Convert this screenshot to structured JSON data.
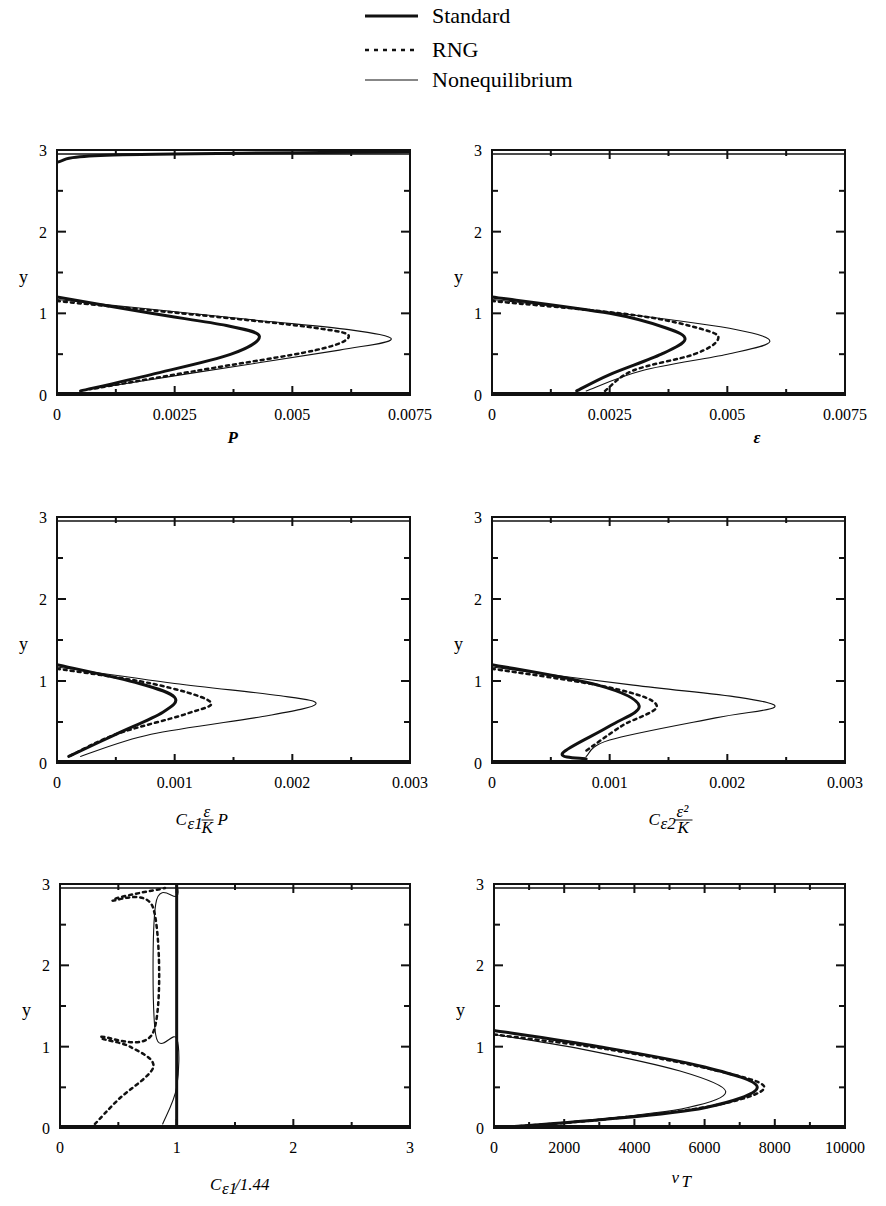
{
  "legend": {
    "entries": [
      {
        "name": "Standard",
        "style": "thick-solid"
      },
      {
        "name": "RNG",
        "style": "dotted"
      },
      {
        "name": "Nonequilibrium",
        "style": "thin-solid"
      }
    ]
  },
  "chart_data": [
    {
      "type": "line",
      "title": "",
      "xlabel": "P",
      "ylabel": "y",
      "xlim": [
        0,
        0.0075
      ],
      "ylim": [
        0,
        3
      ],
      "xticks": [
        "0",
        "0.0025",
        "0.005",
        "0.0075"
      ],
      "yticks": [
        "0",
        "1",
        "2",
        "3"
      ],
      "series": [
        {
          "name": "Standard",
          "points": [
            [
              0.0,
              1.2
            ],
            [
              0.002,
              1.0
            ],
            [
              0.0036,
              0.85
            ],
            [
              0.0043,
              0.72
            ],
            [
              0.0037,
              0.5
            ],
            [
              0.002,
              0.25
            ],
            [
              0.0005,
              0.05
            ],
            [
              0.0,
              2.85
            ],
            [
              0.0012,
              2.94
            ],
            [
              0.0075,
              2.98
            ]
          ]
        },
        {
          "name": "RNG",
          "points": [
            [
              0.0,
              1.15
            ],
            [
              0.0035,
              0.95
            ],
            [
              0.0055,
              0.82
            ],
            [
              0.0062,
              0.72
            ],
            [
              0.0055,
              0.55
            ],
            [
              0.003,
              0.3
            ],
            [
              0.0007,
              0.07
            ]
          ]
        },
        {
          "name": "Nonequilibrium",
          "points": [
            [
              0.0,
              1.17
            ],
            [
              0.004,
              0.93
            ],
            [
              0.0062,
              0.8
            ],
            [
              0.0071,
              0.68
            ],
            [
              0.006,
              0.55
            ],
            [
              0.003,
              0.28
            ],
            [
              0.0007,
              0.07
            ]
          ]
        }
      ]
    },
    {
      "type": "line",
      "title": "",
      "xlabel": "ε",
      "ylabel": "y",
      "xlim": [
        0,
        0.0075
      ],
      "ylim": [
        0,
        3
      ],
      "xticks": [
        "0",
        "0.0025",
        "0.005",
        "0.0075"
      ],
      "yticks": [
        "0",
        "1",
        "2",
        "3"
      ],
      "series": [
        {
          "name": "Standard",
          "points": [
            [
              0.0,
              1.2
            ],
            [
              0.0025,
              1.0
            ],
            [
              0.0037,
              0.82
            ],
            [
              0.0041,
              0.68
            ],
            [
              0.0036,
              0.5
            ],
            [
              0.0025,
              0.25
            ],
            [
              0.0018,
              0.05
            ]
          ]
        },
        {
          "name": "RNG",
          "points": [
            [
              0.0,
              1.15
            ],
            [
              0.003,
              0.98
            ],
            [
              0.0045,
              0.8
            ],
            [
              0.0048,
              0.68
            ],
            [
              0.0043,
              0.5
            ],
            [
              0.003,
              0.3
            ],
            [
              0.0024,
              0.05
            ]
          ]
        },
        {
          "name": "Nonequilibrium",
          "points": [
            [
              0.0,
              1.17
            ],
            [
              0.003,
              0.98
            ],
            [
              0.0052,
              0.8
            ],
            [
              0.0059,
              0.65
            ],
            [
              0.005,
              0.5
            ],
            [
              0.0032,
              0.3
            ],
            [
              0.002,
              0.05
            ]
          ]
        }
      ]
    },
    {
      "type": "line",
      "title": "",
      "xlabel": "Cε1 (ε/K) P",
      "ylabel": "y",
      "xlim": [
        0,
        0.003
      ],
      "ylim": [
        0,
        3
      ],
      "xticks": [
        "0",
        "0.001",
        "0.002",
        "0.003"
      ],
      "yticks": [
        "0",
        "1",
        "2",
        "3"
      ],
      "series": [
        {
          "name": "Standard",
          "points": [
            [
              0.0,
              1.2
            ],
            [
              0.0007,
              0.97
            ],
            [
              0.001,
              0.8
            ],
            [
              0.0009,
              0.62
            ],
            [
              0.0005,
              0.35
            ],
            [
              0.0001,
              0.08
            ]
          ]
        },
        {
          "name": "RNG",
          "points": [
            [
              0.0,
              1.15
            ],
            [
              0.0008,
              0.97
            ],
            [
              0.0013,
              0.75
            ],
            [
              0.0011,
              0.6
            ],
            [
              0.0005,
              0.35
            ],
            [
              0.0001,
              0.08
            ]
          ]
        },
        {
          "name": "Nonequilibrium",
          "points": [
            [
              0.0,
              1.17
            ],
            [
              0.001,
              0.97
            ],
            [
              0.0019,
              0.82
            ],
            [
              0.0022,
              0.72
            ],
            [
              0.0018,
              0.58
            ],
            [
              0.0008,
              0.35
            ],
            [
              0.0002,
              0.08
            ]
          ]
        }
      ]
    },
    {
      "type": "line",
      "title": "",
      "xlabel": "Cε2 ε²/K",
      "ylabel": "y",
      "xlim": [
        0,
        0.003
      ],
      "ylim": [
        0,
        3
      ],
      "xticks": [
        "0",
        "0.001",
        "0.002",
        "0.003"
      ],
      "yticks": [
        "0",
        "1",
        "2",
        "3"
      ],
      "series": [
        {
          "name": "Standard",
          "points": [
            [
              0.0,
              1.2
            ],
            [
              0.0009,
              0.95
            ],
            [
              0.00125,
              0.7
            ],
            [
              0.001,
              0.45
            ],
            [
              0.0006,
              0.12
            ],
            [
              0.0008,
              0.05
            ]
          ]
        },
        {
          "name": "RNG",
          "points": [
            [
              0.0,
              1.15
            ],
            [
              0.001,
              0.92
            ],
            [
              0.0014,
              0.7
            ],
            [
              0.0011,
              0.45
            ],
            [
              0.0008,
              0.15
            ]
          ]
        },
        {
          "name": "Nonequilibrium",
          "points": [
            [
              0.0,
              1.17
            ],
            [
              0.0012,
              0.95
            ],
            [
              0.0021,
              0.8
            ],
            [
              0.0024,
              0.68
            ],
            [
              0.0019,
              0.55
            ],
            [
              0.001,
              0.28
            ],
            [
              0.0008,
              0.08
            ]
          ]
        }
      ]
    },
    {
      "type": "line",
      "title": "",
      "xlabel": "Cε1/1.44",
      "ylabel": "y",
      "xlim": [
        0,
        3
      ],
      "ylim": [
        0,
        3
      ],
      "xticks": [
        "0",
        "1",
        "2",
        "3"
      ],
      "yticks": [
        "0",
        "1",
        "2",
        "3"
      ],
      "series": [
        {
          "name": "Standard",
          "points": [
            [
              1.0,
              0.0
            ],
            [
              1.0,
              3.0
            ]
          ]
        },
        {
          "name": "RNG",
          "points": [
            [
              0.3,
              0.05
            ],
            [
              0.5,
              0.35
            ],
            [
              0.8,
              0.75
            ],
            [
              0.6,
              1.0
            ],
            [
              0.35,
              1.12
            ],
            [
              0.8,
              1.18
            ],
            [
              0.8,
              2.7
            ],
            [
              0.45,
              2.8
            ],
            [
              0.9,
              2.95
            ]
          ]
        },
        {
          "name": "Nonequilibrium",
          "points": [
            [
              0.88,
              0.05
            ],
            [
              1.0,
              0.5
            ],
            [
              1.0,
              1.1
            ],
            [
              0.82,
              1.15
            ],
            [
              0.82,
              2.75
            ],
            [
              1.0,
              2.85
            ],
            [
              1.0,
              3.0
            ]
          ]
        }
      ]
    },
    {
      "type": "line",
      "title": "",
      "xlabel": "νT",
      "ylabel": "y",
      "xlim": [
        0,
        10000
      ],
      "ylim": [
        0,
        3
      ],
      "xticks": [
        "0",
        "2000",
        "4000",
        "6000",
        "8000",
        "10000"
      ],
      "yticks": [
        "0",
        "1",
        "2",
        "3"
      ],
      "series": [
        {
          "name": "Standard",
          "points": [
            [
              0,
              1.2
            ],
            [
              3000,
              1.0
            ],
            [
              6000,
              0.75
            ],
            [
              7500,
              0.5
            ],
            [
              6000,
              0.25
            ],
            [
              3000,
              0.1
            ],
            [
              0,
              0.0
            ]
          ]
        },
        {
          "name": "RNG",
          "points": [
            [
              0,
              1.15
            ],
            [
              3200,
              0.97
            ],
            [
              6200,
              0.72
            ],
            [
              7700,
              0.5
            ],
            [
              6200,
              0.27
            ],
            [
              3000,
              0.1
            ],
            [
              0,
              0.0
            ]
          ]
        },
        {
          "name": "Nonequilibrium",
          "points": [
            [
              0,
              1.15
            ],
            [
              2500,
              0.97
            ],
            [
              5300,
              0.7
            ],
            [
              6600,
              0.45
            ],
            [
              5500,
              0.25
            ],
            [
              2800,
              0.1
            ],
            [
              0,
              0.0
            ]
          ]
        }
      ]
    }
  ],
  "panels": [
    {
      "xlabel": "P",
      "ticks": [
        "0",
        "0.0025",
        "0.005",
        "0.0075"
      ]
    },
    {
      "xlabel": "ε",
      "ticks": [
        "0",
        "0.0025",
        "0.005",
        "0.0075"
      ]
    },
    {
      "xlabel": "Cε1 ε/K P",
      "ticks": [
        "0",
        "0.001",
        "0.002",
        "0.003"
      ]
    },
    {
      "xlabel": "Cε2 ε²/K",
      "ticks": [
        "0",
        "0.001",
        "0.002",
        "0.003"
      ]
    },
    {
      "xlabel": "Cε1/1.44",
      "ticks": [
        "0",
        "1",
        "2",
        "3"
      ]
    },
    {
      "xlabel": "νT",
      "ticks": [
        "0",
        "2000",
        "4000",
        "6000",
        "8000",
        "10000"
      ]
    }
  ],
  "ylabel": "y",
  "yticks": [
    "0",
    "1",
    "2",
    "3"
  ]
}
